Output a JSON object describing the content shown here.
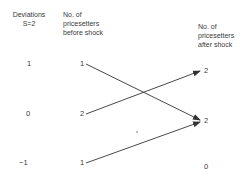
{
  "columns": {
    "deviations": {
      "header": "Deviations\nS=2",
      "values": [
        "1",
        "0",
        "−1"
      ]
    },
    "before_shock": {
      "header": "No. of\npricesetters\nbefore shock",
      "values": [
        "1",
        "2",
        "1"
      ]
    },
    "after_shock": {
      "header": "No. of\npricesetters\nafter shock",
      "values": [
        "2",
        "2",
        "0"
      ]
    }
  },
  "arrows": [
    {
      "from": "before_shock.0",
      "to": "after_shock.1"
    },
    {
      "from": "before_shock.1",
      "to": "after_shock.0"
    },
    {
      "from": "before_shock.2",
      "to": "after_shock.1"
    }
  ],
  "colors": {
    "line": "#333333",
    "text": "#3a3a3a"
  }
}
